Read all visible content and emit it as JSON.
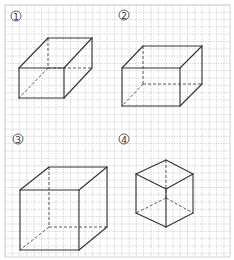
{
  "figure": {
    "width": 234,
    "height": 260,
    "grid": {
      "spacing": 7.3,
      "x0": 5,
      "y0": 5,
      "x1": 230,
      "y1": 257,
      "dot_color": "#b8b8b8"
    },
    "line_color": "#333333",
    "panels": [
      {
        "label": "1",
        "label_glyph": "①",
        "label_pos": [
          16,
          16
        ],
        "shape": "rectangular-prism",
        "solid_edges": [
          [
            [
              19,
              68
            ],
            [
              64,
              68
            ]
          ],
          [
            [
              64,
              68
            ],
            [
              64,
              98
            ]
          ],
          [
            [
              64,
              98
            ],
            [
              19,
              98
            ]
          ],
          [
            [
              19,
              98
            ],
            [
              19,
              68
            ]
          ],
          [
            [
              19,
              68
            ],
            [
              48,
              38
            ]
          ],
          [
            [
              48,
              38
            ],
            [
              92,
              38
            ]
          ],
          [
            [
              92,
              38
            ],
            [
              64,
              68
            ]
          ],
          [
            [
              92,
              38
            ],
            [
              92,
              68
            ]
          ],
          [
            [
              92,
              68
            ],
            [
              64,
              98
            ]
          ]
        ],
        "hidden_edges": [
          [
            [
              48,
              38
            ],
            [
              48,
              68
            ]
          ],
          [
            [
              48,
              68
            ],
            [
              92,
              68
            ]
          ],
          [
            [
              48,
              68
            ],
            [
              19,
              98
            ]
          ]
        ]
      },
      {
        "label": "2",
        "label_glyph": "②",
        "label_pos": [
          124,
          15
        ],
        "shape": "rectangular-prism",
        "solid_edges": [
          [
            [
              122,
              68
            ],
            [
              180,
              68
            ]
          ],
          [
            [
              180,
              68
            ],
            [
              180,
              106
            ]
          ],
          [
            [
              180,
              106
            ],
            [
              122,
              106
            ]
          ],
          [
            [
              122,
              106
            ],
            [
              122,
              68
            ]
          ],
          [
            [
              122,
              68
            ],
            [
              143,
              46
            ]
          ],
          [
            [
              143,
              46
            ],
            [
              202,
              46
            ]
          ],
          [
            [
              202,
              46
            ],
            [
              180,
              68
            ]
          ],
          [
            [
              202,
              46
            ],
            [
              202,
              84
            ]
          ],
          [
            [
              202,
              84
            ],
            [
              180,
              106
            ]
          ]
        ],
        "hidden_edges": [
          [
            [
              143,
              46
            ],
            [
              143,
              84
            ]
          ],
          [
            [
              143,
              84
            ],
            [
              202,
              84
            ]
          ],
          [
            [
              143,
              84
            ],
            [
              122,
              106
            ]
          ]
        ]
      },
      {
        "label": "3",
        "label_glyph": "③",
        "label_pos": [
          18,
          139
        ],
        "shape": "cube",
        "solid_edges": [
          [
            [
              20,
              190
            ],
            [
              79,
              190
            ]
          ],
          [
            [
              79,
              190
            ],
            [
              79,
              250
            ]
          ],
          [
            [
              79,
              250
            ],
            [
              20,
              250
            ]
          ],
          [
            [
              20,
              250
            ],
            [
              20,
              190
            ]
          ],
          [
            [
              20,
              190
            ],
            [
              49,
              167
            ]
          ],
          [
            [
              49,
              167
            ],
            [
              107,
              167
            ]
          ],
          [
            [
              107,
              167
            ],
            [
              79,
              190
            ]
          ],
          [
            [
              107,
              167
            ],
            [
              107,
              227
            ]
          ],
          [
            [
              107,
              227
            ],
            [
              79,
              250
            ]
          ]
        ],
        "hidden_edges": [
          [
            [
              49,
              167
            ],
            [
              49,
              227
            ]
          ],
          [
            [
              49,
              227
            ],
            [
              107,
              227
            ]
          ],
          [
            [
              49,
              227
            ],
            [
              20,
              250
            ]
          ]
        ]
      },
      {
        "label": "4",
        "label_glyph": "④",
        "label_pos": [
          124,
          139
        ],
        "shape": "cube-isometric",
        "solid_edges": [
          [
            [
              166,
              160
            ],
            [
              193,
              174
            ]
          ],
          [
            [
              193,
              174
            ],
            [
              166,
              189
            ]
          ],
          [
            [
              166,
              189
            ],
            [
              136,
              174
            ]
          ],
          [
            [
              136,
              174
            ],
            [
              166,
              160
            ]
          ],
          [
            [
              136,
              174
            ],
            [
              136,
              213
            ]
          ],
          [
            [
              136,
              213
            ],
            [
              166,
              227
            ]
          ],
          [
            [
              166,
              227
            ],
            [
              193,
              213
            ]
          ],
          [
            [
              193,
              213
            ],
            [
              193,
              174
            ]
          ],
          [
            [
              166,
              189
            ],
            [
              166,
              227
            ]
          ]
        ],
        "hidden_edges": [
          [
            [
              166,
              160
            ],
            [
              166,
              198
            ]
          ],
          [
            [
              166,
              198
            ],
            [
              136,
              213
            ]
          ],
          [
            [
              166,
              198
            ],
            [
              193,
              213
            ]
          ]
        ]
      }
    ]
  }
}
